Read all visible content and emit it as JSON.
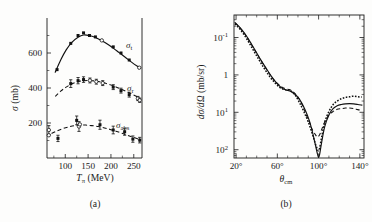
{
  "figure": {
    "background_color": "#fdfdfc",
    "ink_color": "#111111"
  },
  "panel_a": {
    "caption": "(a)",
    "caption_open": "(",
    "caption_letter": "a",
    "caption_close": ")",
    "y_axis_title_main": "σ",
    "y_axis_title_units": "(mb)",
    "x_axis_title_main": "T",
    "x_axis_title_sub": "π",
    "x_axis_title_units": "(MeV)",
    "y_tick_labels": [
      "200",
      "400",
      "600"
    ],
    "x_tick_labels": [
      "100",
      "150",
      "200",
      "250"
    ],
    "series_labels": {
      "total": "σ",
      "total_sub": "t",
      "reaction": "σ",
      "reaction_sub": "r",
      "absorption": "σ",
      "absorption_sub": "abs"
    }
  },
  "panel_b": {
    "caption": "(b)",
    "caption_open": "(",
    "caption_letter": "b",
    "caption_close": ")",
    "y_axis_title_d1": "d",
    "y_axis_title_sigma": "σ",
    "y_axis_title_d2": "/d",
    "y_axis_title_omega": "Ω",
    "y_axis_title_units": "(mb/sr)",
    "x_axis_title_main": "θ",
    "x_axis_title_sub": "cm",
    "y_tick_labels": [
      "10",
      "10",
      "1",
      "10"
    ],
    "y_tick_exponents": [
      "2",
      "1",
      "",
      "-1"
    ],
    "x_tick_labels": [
      "20°",
      "60°",
      "100°",
      "140°"
    ]
  },
  "chart_data": [
    {
      "id": "panel_a",
      "type": "scatter",
      "title": "",
      "xlabel": "T_pi (MeV)",
      "ylabel": "sigma (mb)",
      "xlim": [
        60,
        268
      ],
      "ylim": [
        0,
        800
      ],
      "xticks": [
        100,
        150,
        200,
        250
      ],
      "yticks": [
        200,
        400,
        600
      ],
      "yticks_minor": [
        100,
        300,
        500,
        700
      ],
      "grid": false,
      "legend_position": "inline-right",
      "series": [
        {
          "name": "sigma_t",
          "label": "σ_t",
          "curve_style": "solid",
          "curve_x": [
            78,
            90,
            102,
            115,
            128,
            140,
            152,
            165,
            178,
            192,
            205,
            218,
            232,
            245,
            258,
            264
          ],
          "curve_y": [
            490,
            560,
            618,
            662,
            690,
            703,
            700,
            690,
            673,
            652,
            628,
            602,
            574,
            548,
            524,
            514
          ],
          "points": [
            {
              "x": 82,
              "y": 505,
              "marker": "filled",
              "yerr": 0
            },
            {
              "x": 112,
              "y": 655,
              "marker": "filled",
              "yerr": 0
            },
            {
              "x": 128,
              "y": 700,
              "marker": "filled",
              "yerr": 0
            },
            {
              "x": 140,
              "y": 715,
              "marker": "filled",
              "yerr": 0
            },
            {
              "x": 153,
              "y": 700,
              "marker": "filled",
              "yerr": 0
            },
            {
              "x": 166,
              "y": 692,
              "marker": "filled",
              "yerr": 0
            },
            {
              "x": 180,
              "y": 672,
              "marker": "open",
              "yerr": 0
            },
            {
              "x": 205,
              "y": 635,
              "marker": "filled",
              "yerr": 0
            },
            {
              "x": 222,
              "y": 600,
              "marker": "filled",
              "yerr": 0
            },
            {
              "x": 240,
              "y": 560,
              "marker": "filled",
              "yerr": 0
            },
            {
              "x": 262,
              "y": 516,
              "marker": "open",
              "yerr": 0
            }
          ]
        },
        {
          "name": "sigma_r",
          "label": "σ_r",
          "curve_style": "dashed",
          "curve_x": [
            78,
            90,
            102,
            115,
            128,
            140,
            152,
            165,
            178,
            192,
            205,
            218,
            232,
            245,
            258,
            264
          ],
          "curve_y": [
            352,
            382,
            405,
            424,
            436,
            442,
            443,
            440,
            434,
            424,
            412,
            398,
            382,
            366,
            350,
            342
          ],
          "points": [
            {
              "x": 112,
              "y": 425,
              "marker": "filled",
              "yerr": 22
            },
            {
              "x": 128,
              "y": 442,
              "marker": "filled",
              "yerr": 18
            },
            {
              "x": 140,
              "y": 448,
              "marker": "filled",
              "yerr": 16
            },
            {
              "x": 154,
              "y": 443,
              "marker": "open",
              "yerr": 14
            },
            {
              "x": 168,
              "y": 436,
              "marker": "open",
              "yerr": 14
            },
            {
              "x": 182,
              "y": 428,
              "marker": "open",
              "yerr": 14
            },
            {
              "x": 205,
              "y": 405,
              "marker": "filled",
              "yerr": 14
            },
            {
              "x": 222,
              "y": 385,
              "marker": "filled",
              "yerr": 14
            },
            {
              "x": 240,
              "y": 362,
              "marker": "filled",
              "yerr": 14
            },
            {
              "x": 259,
              "y": 340,
              "marker": "open",
              "yerr": 12
            },
            {
              "x": 263,
              "y": 330,
              "marker": "open",
              "yerr": 12
            }
          ]
        },
        {
          "name": "sigma_abs",
          "label": "σ_abs",
          "curve_style": "dashed",
          "curve_x": [
            70,
            82,
            95,
            108,
            120,
            133,
            145,
            158,
            172,
            186,
            200,
            215,
            230,
            245,
            258,
            264
          ],
          "curve_y": [
            140,
            155,
            168,
            178,
            185,
            188,
            188,
            185,
            180,
            172,
            162,
            150,
            136,
            122,
            110,
            104
          ],
          "points": [
            {
              "x": 64,
              "y": 160,
              "marker": "open",
              "yerr": 25
            },
            {
              "x": 64,
              "y": 130,
              "marker": "open",
              "yerr": 0
            },
            {
              "x": 84,
              "y": 112,
              "marker": "filled",
              "yerr": 18
            },
            {
              "x": 125,
              "y": 215,
              "marker": "filled",
              "yerr": 25
            },
            {
              "x": 130,
              "y": 180,
              "marker": "open",
              "yerr": 28
            },
            {
              "x": 132,
              "y": 192,
              "marker": "open",
              "yerr": 0
            },
            {
              "x": 176,
              "y": 190,
              "marker": "filled",
              "yerr": 26
            },
            {
              "x": 205,
              "y": 160,
              "marker": "filled",
              "yerr": 22
            },
            {
              "x": 230,
              "y": 150,
              "marker": "filled",
              "yerr": 20
            },
            {
              "x": 248,
              "y": 108,
              "marker": "filled",
              "yerr": 18
            },
            {
              "x": 263,
              "y": 102,
              "marker": "filled",
              "yerr": 16
            }
          ]
        }
      ]
    },
    {
      "id": "panel_b",
      "type": "line",
      "title": "",
      "xlabel": "theta_cm (deg)",
      "ylabel": "d sigma / d Omega (mb/sr)",
      "yscale": "log",
      "xlim": [
        18,
        144
      ],
      "ylim": [
        0.06,
        400
      ],
      "xticks": [
        20,
        60,
        100,
        140
      ],
      "yticks": [
        0.1,
        1,
        10,
        100
      ],
      "grid": false,
      "series": [
        {
          "name": "data",
          "style": "dotted",
          "x": [
            19,
            22,
            26,
            30,
            34,
            38,
            42,
            46,
            50,
            54,
            58,
            62,
            66,
            68,
            70,
            72,
            74,
            76,
            78,
            82,
            86,
            90,
            94,
            97,
            99,
            100,
            101,
            103,
            106,
            110,
            114,
            118,
            122,
            126,
            130,
            134,
            138,
            142
          ],
          "y": [
            230,
            190,
            140,
            96,
            62,
            40,
            26,
            17,
            11.5,
            8.0,
            6.0,
            4.7,
            4.1,
            4.0,
            4.0,
            3.9,
            3.6,
            3.2,
            2.7,
            1.7,
            1.0,
            0.55,
            0.26,
            0.14,
            0.1,
            0.095,
            0.11,
            0.22,
            0.55,
            1.05,
            1.6,
            2.0,
            2.3,
            2.5,
            2.6,
            2.7,
            2.6,
            2.55
          ]
        },
        {
          "name": "calc-solid",
          "style": "solid",
          "x": [
            19,
            23,
            27,
            31,
            35,
            39,
            43,
            47,
            51,
            55,
            59,
            63,
            66,
            69,
            71,
            73,
            76,
            79,
            83,
            87,
            91,
            94,
            97,
            99,
            100,
            101,
            103,
            106,
            110,
            114,
            118,
            122,
            126,
            130,
            134,
            138,
            142
          ],
          "y": [
            250,
            195,
            143,
            100,
            66,
            43,
            28,
            18.5,
            12.5,
            8.6,
            6.2,
            4.8,
            4.2,
            3.9,
            3.8,
            3.6,
            3.2,
            2.7,
            1.9,
            1.15,
            0.6,
            0.3,
            0.13,
            0.075,
            0.062,
            0.075,
            0.16,
            0.42,
            0.85,
            1.25,
            1.5,
            1.62,
            1.68,
            1.7,
            1.68,
            1.62,
            1.55
          ]
        },
        {
          "name": "calc-dashed",
          "style": "dashed",
          "x": [
            19,
            23,
            27,
            31,
            35,
            39,
            43,
            47,
            51,
            55,
            59,
            63,
            66,
            69,
            71,
            73,
            76,
            79,
            83,
            87,
            91,
            94,
            97,
            99,
            101,
            103,
            106,
            110,
            114,
            118,
            122,
            126,
            130,
            134,
            138,
            142
          ],
          "y": [
            245,
            192,
            140,
            98,
            64,
            42,
            27.5,
            18,
            12.2,
            8.4,
            6.3,
            5.0,
            4.5,
            4.2,
            4.1,
            3.9,
            3.4,
            2.8,
            1.85,
            1.0,
            0.55,
            0.34,
            0.25,
            0.22,
            0.25,
            0.35,
            0.55,
            0.85,
            1.05,
            1.2,
            1.25,
            1.3,
            1.3,
            1.26,
            1.18,
            1.12
          ]
        }
      ]
    }
  ]
}
